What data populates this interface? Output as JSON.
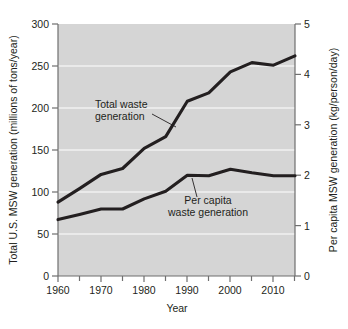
{
  "chart_data": {
    "type": "line",
    "title": "",
    "xlabel": "Year",
    "ylabel": "Total U.S. MSW generation (millions of tons/year)",
    "y2label": "Per capita MSW generation (kg/person/day)",
    "xlim": [
      1960,
      2015
    ],
    "ylim": [
      0,
      300
    ],
    "y2lim": [
      0,
      5
    ],
    "xticks": [
      1960,
      1970,
      1980,
      1990,
      2000,
      2010
    ],
    "xticklabels": [
      "1960",
      "1970",
      "1980",
      "1990",
      "2000",
      "2010"
    ],
    "xminorticks": [
      1965,
      1975,
      1985,
      1995,
      2005
    ],
    "yticks": [
      0,
      50,
      100,
      150,
      200,
      250,
      300
    ],
    "yticklabels": [
      "0",
      "50",
      "100",
      "150",
      "200",
      "250",
      "300"
    ],
    "y2ticks": [
      0,
      1,
      2,
      3,
      4,
      5
    ],
    "y2ticklabels": [
      "0",
      "1",
      "2",
      "3",
      "4",
      "5"
    ],
    "grid": true,
    "grid_orientation": "horizontal",
    "legend": "annotations",
    "plot_background": "#d5d5d5",
    "line_color": "#231f20",
    "series": [
      {
        "name": "Total waste generation",
        "axis": "left",
        "units": "millions of tons/year",
        "x": [
          1960,
          1965,
          1970,
          1975,
          1980,
          1985,
          1990,
          1995,
          2000,
          2005,
          2010,
          2015
        ],
        "values": [
          88,
          104,
          121,
          128,
          152,
          166,
          208,
          218,
          243,
          254,
          251,
          262
        ]
      },
      {
        "name": "Per capita waste generation",
        "axis": "right",
        "units": "kg/person/day",
        "x": [
          1960,
          1965,
          1970,
          1975,
          1980,
          1985,
          1990,
          1995,
          2000,
          2005,
          2010,
          2015
        ],
        "values": [
          1.12,
          1.22,
          1.33,
          1.33,
          1.53,
          1.68,
          2.0,
          1.99,
          2.12,
          2.05,
          1.99,
          1.99
        ]
      }
    ],
    "annotations": [
      {
        "id": "total-waste-annotation",
        "line1": "Total waste",
        "line2": "generation",
        "target_series": "Total waste generation"
      },
      {
        "id": "per-capita-annotation",
        "line1": "Per capita",
        "line2": "waste generation",
        "target_series": "Per capita waste generation"
      }
    ]
  }
}
